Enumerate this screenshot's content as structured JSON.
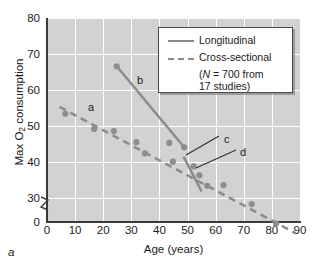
{
  "figure": {
    "panel_label": "a"
  },
  "chart_data": {
    "type": "scatter",
    "title": "",
    "xlabel": "Age (years)",
    "ylabel": "Max O2 consumption",
    "ylabel_parts": {
      "pre": "Max O",
      "sub": "2",
      "post": " consumption"
    },
    "xlim": [
      0,
      90
    ],
    "ylim": [
      0,
      80
    ],
    "y_axis_break": true,
    "y_axis_break_note": "axis broken between 0 and 30",
    "grid": true,
    "grid_color": "#ffffff",
    "plot_background": "#d2d2d2",
    "series_color": "#8d8d8d",
    "xticks": [
      0,
      10,
      20,
      30,
      40,
      50,
      60,
      70,
      80,
      90
    ],
    "yticks": [
      0,
      30,
      40,
      50,
      60,
      70,
      80
    ],
    "series": [
      {
        "name": "Cross-sectional",
        "style": "dashed",
        "trend_line": {
          "x": [
            4.5,
            88.5
          ],
          "y": [
            55.3,
            20.2
          ]
        },
        "points": [
          {
            "x": 6.5,
            "y": 53.4
          },
          {
            "x": 16.8,
            "y": 49.2
          },
          {
            "x": 23.8,
            "y": 48.6
          },
          {
            "x": 31.8,
            "y": 45.5
          },
          {
            "x": 34.8,
            "y": 42.4
          },
          {
            "x": 43.5,
            "y": 45.3
          },
          {
            "x": 44.8,
            "y": 40.1
          },
          {
            "x": 52.2,
            "y": 38.8
          },
          {
            "x": 54.2,
            "y": 36.3
          },
          {
            "x": 57.0,
            "y": 33.4
          },
          {
            "x": 62.8,
            "y": 33.6
          },
          {
            "x": 72.8,
            "y": 28.3
          },
          {
            "x": 81.5,
            "y": 22.9
          }
        ]
      },
      {
        "name": "Longitudinal",
        "style": "solid",
        "segments": [
          {
            "x": [
              24.8,
              48.8
            ],
            "y": [
              66.6,
              44.1
            ]
          },
          {
            "x": [
              48.6,
              55.0
            ],
            "y": [
              41.5,
              31.8
            ]
          }
        ],
        "points": [
          {
            "x": 24.8,
            "y": 66.6
          },
          {
            "x": 48.8,
            "y": 44.1
          }
        ]
      }
    ],
    "annotations": [
      {
        "label": "a",
        "x_px": 88,
        "y_px": 101,
        "leader": false
      },
      {
        "label": "b",
        "x_px": 137,
        "y_px": 74,
        "leader": false
      },
      {
        "label": "c",
        "x_px": 224,
        "y_px": 133,
        "leader": true
      },
      {
        "label": "d",
        "x_px": 240,
        "y_px": 146,
        "leader": true
      }
    ],
    "legend": {
      "position": "upper-right-inside",
      "entries": [
        {
          "label": "Longitudinal",
          "style": "solid"
        },
        {
          "label": "Cross-sectional",
          "style": "dashed"
        }
      ],
      "note_line1_pre": "(",
      "note_line1_n": "N",
      "note_line1_post": " = 700 from",
      "note_line2": "17 studies)"
    }
  }
}
